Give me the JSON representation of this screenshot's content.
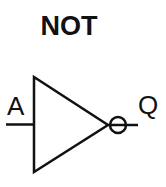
{
  "diagram": {
    "title": "NOT",
    "gate_type": "NOT gate (inverter)",
    "input_label": "A",
    "output_label": "Q",
    "stroke_color": "#111111",
    "background_color": "#ffffff"
  }
}
